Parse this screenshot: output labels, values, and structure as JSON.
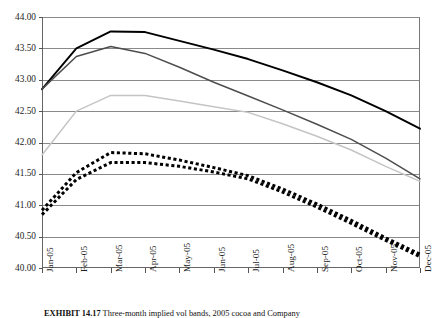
{
  "chart_data": {
    "type": "line",
    "title": "",
    "xlabel": "",
    "ylabel": "",
    "ylim": [
      40.0,
      44.0
    ],
    "ytick_step": 0.5,
    "ytick_labels": [
      "44.00",
      "43.50",
      "43.00",
      "42.50",
      "42.00",
      "41.50",
      "41.00",
      "40.50",
      "40.00"
    ],
    "grid": true,
    "legend": "none",
    "categories": [
      "Jan-05",
      "Feb-05",
      "Mar-05",
      "Apr-05",
      "May-05",
      "Jun-05",
      "Jul-05",
      "Aug-05",
      "Sep-05",
      "Oct-05",
      "Nov-05",
      "Dec-05"
    ],
    "series": [
      {
        "name": "series-1-black-solid",
        "style": "solid",
        "color": "#000000",
        "width": 1.9,
        "values": [
          42.85,
          43.5,
          43.77,
          43.76,
          43.62,
          43.48,
          43.33,
          43.15,
          42.96,
          42.75,
          42.5,
          42.22
        ]
      },
      {
        "name": "series-2-dark-gray-solid",
        "style": "solid",
        "color": "#4d4d4d",
        "width": 1.5,
        "values": [
          42.85,
          43.37,
          43.53,
          43.42,
          43.2,
          42.96,
          42.74,
          42.52,
          42.29,
          42.05,
          41.75,
          41.42
        ]
      },
      {
        "name": "series-3-light-gray-solid",
        "style": "solid",
        "color": "#c4c4c4",
        "width": 1.5,
        "values": [
          41.8,
          42.5,
          42.75,
          42.75,
          42.66,
          42.57,
          42.48,
          42.3,
          42.1,
          41.88,
          41.62,
          41.38
        ]
      },
      {
        "name": "series-4-black-dotted-upper",
        "style": "dotted",
        "color": "#000000",
        "width": 3.0,
        "values": [
          40.92,
          41.52,
          41.84,
          41.82,
          41.72,
          41.6,
          41.47,
          41.26,
          41.02,
          40.76,
          40.48,
          40.22
        ]
      },
      {
        "name": "series-5-black-dotted-lower",
        "style": "dotted",
        "color": "#000000",
        "width": 3.0,
        "values": [
          40.85,
          41.41,
          41.68,
          41.68,
          41.62,
          41.53,
          41.42,
          41.21,
          40.97,
          40.71,
          40.44,
          40.18
        ]
      }
    ]
  },
  "caption": {
    "label": "EXHIBIT 14.17",
    "text": "Three-month implied vol bands, 2005 cocoa and Company"
  }
}
